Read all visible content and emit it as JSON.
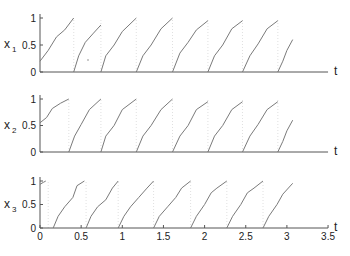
{
  "chart_data": {
    "type": "line",
    "layout": "3 stacked panels sharing time axis",
    "grid": false,
    "legend": null,
    "x_axis": {
      "label": "t",
      "range": [
        0,
        3.5
      ],
      "ticks": [
        "0",
        "0.5",
        "1",
        "1.5",
        "2",
        "2.5",
        "3",
        "3.5"
      ],
      "tick_labels_shown_on": "bottom panel only"
    },
    "colors": {
      "line": "#7a7a7a",
      "axis": "#555555",
      "reset_marker": "#d8d8d8",
      "text": "#222222"
    },
    "panels": [
      {
        "ylabel": "x",
        "ylabel_sub": "1",
        "ylim": [
          0,
          1
        ],
        "yticks": [
          "0",
          "0.5",
          "1"
        ],
        "description": "sawtooth-like phase variable rising from 0 to ~1 then resetting",
        "segments": [
          [
            [
              0,
              0.2
            ],
            [
              0.1,
              0.4
            ],
            [
              0.2,
              0.65
            ],
            [
              0.3,
              0.78
            ],
            [
              0.41,
              1.0
            ]
          ],
          [
            [
              0.41,
              0
            ],
            [
              0.47,
              0.3
            ],
            [
              0.55,
              0.55
            ],
            [
              0.65,
              0.72
            ],
            [
              0.74,
              0.87
            ]
          ],
          [
            [
              0.74,
              0
            ],
            [
              0.8,
              0.3
            ],
            [
              0.9,
              0.5
            ],
            [
              1.0,
              0.75
            ],
            [
              1.17,
              1.0
            ]
          ],
          [
            [
              1.17,
              0
            ],
            [
              1.25,
              0.3
            ],
            [
              1.35,
              0.5
            ],
            [
              1.47,
              0.8
            ],
            [
              1.61,
              1.0
            ]
          ],
          [
            [
              1.61,
              0
            ],
            [
              1.7,
              0.35
            ],
            [
              1.8,
              0.55
            ],
            [
              1.9,
              0.78
            ],
            [
              2.04,
              0.95
            ]
          ],
          [
            [
              2.04,
              0
            ],
            [
              2.12,
              0.3
            ],
            [
              2.22,
              0.5
            ],
            [
              2.33,
              0.8
            ],
            [
              2.46,
              0.95
            ]
          ],
          [
            [
              2.46,
              0
            ],
            [
              2.55,
              0.3
            ],
            [
              2.65,
              0.52
            ],
            [
              2.76,
              0.8
            ],
            [
              2.89,
              0.95
            ]
          ],
          [
            [
              2.89,
              0
            ],
            [
              2.95,
              0.2
            ],
            [
              3.0,
              0.4
            ],
            [
              3.07,
              0.6
            ]
          ]
        ],
        "resets": [
          0.41,
          0.74,
          1.17,
          1.61,
          2.04,
          2.46,
          2.89
        ]
      },
      {
        "ylabel": "x",
        "ylabel_sub": "2",
        "ylim": [
          0,
          1
        ],
        "yticks": [
          "0",
          "0.5",
          "1"
        ],
        "segments": [
          [
            [
              0,
              0.55
            ],
            [
              0.08,
              0.65
            ],
            [
              0.15,
              0.82
            ],
            [
              0.25,
              0.92
            ],
            [
              0.35,
              1.0
            ]
          ],
          [
            [
              0.35,
              0
            ],
            [
              0.42,
              0.3
            ],
            [
              0.5,
              0.52
            ],
            [
              0.6,
              0.8
            ],
            [
              0.74,
              1.0
            ]
          ],
          [
            [
              0.74,
              0
            ],
            [
              0.8,
              0.3
            ],
            [
              0.9,
              0.5
            ],
            [
              1.0,
              0.8
            ],
            [
              1.17,
              1.0
            ]
          ],
          [
            [
              1.17,
              0
            ],
            [
              1.25,
              0.3
            ],
            [
              1.35,
              0.5
            ],
            [
              1.47,
              0.8
            ],
            [
              1.61,
              1.0
            ]
          ],
          [
            [
              1.61,
              0
            ],
            [
              1.7,
              0.3
            ],
            [
              1.8,
              0.5
            ],
            [
              1.9,
              0.8
            ],
            [
              2.04,
              0.95
            ]
          ],
          [
            [
              2.04,
              0
            ],
            [
              2.12,
              0.3
            ],
            [
              2.22,
              0.5
            ],
            [
              2.33,
              0.8
            ],
            [
              2.46,
              0.95
            ]
          ],
          [
            [
              2.46,
              0
            ],
            [
              2.55,
              0.3
            ],
            [
              2.65,
              0.52
            ],
            [
              2.76,
              0.8
            ],
            [
              2.89,
              0.95
            ]
          ],
          [
            [
              2.89,
              0
            ],
            [
              2.95,
              0.2
            ],
            [
              3.0,
              0.4
            ],
            [
              3.07,
              0.6
            ]
          ]
        ],
        "resets": [
          0.35,
          0.74,
          1.17,
          1.61,
          2.04,
          2.46,
          2.89
        ]
      },
      {
        "ylabel": "x",
        "ylabel_sub": "3",
        "ylim": [
          0,
          1
        ],
        "yticks": [
          "0",
          "0.5",
          "1"
        ],
        "segments": [
          [
            [
              0,
              0.93
            ],
            [
              0.04,
              0.97
            ],
            [
              0.07,
              1.0
            ]
          ],
          [
            [
              0.16,
              0
            ],
            [
              0.22,
              0.25
            ],
            [
              0.3,
              0.45
            ],
            [
              0.4,
              0.65
            ],
            [
              0.45,
              0.9
            ],
            [
              0.54,
              1.0
            ]
          ],
          [
            [
              0.56,
              0
            ],
            [
              0.62,
              0.25
            ],
            [
              0.7,
              0.45
            ],
            [
              0.8,
              0.6
            ],
            [
              0.88,
              0.85
            ],
            [
              0.95,
              1.0
            ]
          ],
          [
            [
              0.95,
              0
            ],
            [
              1.02,
              0.25
            ],
            [
              1.1,
              0.45
            ],
            [
              1.2,
              0.65
            ],
            [
              1.3,
              0.85
            ],
            [
              1.38,
              1.0
            ]
          ],
          [
            [
              1.38,
              0
            ],
            [
              1.45,
              0.25
            ],
            [
              1.55,
              0.45
            ],
            [
              1.65,
              0.65
            ],
            [
              1.72,
              0.85
            ],
            [
              1.83,
              1.0
            ]
          ],
          [
            [
              1.83,
              0
            ],
            [
              1.9,
              0.25
            ],
            [
              2.0,
              0.5
            ],
            [
              2.08,
              0.75
            ],
            [
              2.15,
              0.85
            ],
            [
              2.27,
              1.0
            ]
          ],
          [
            [
              2.27,
              0
            ],
            [
              2.34,
              0.25
            ],
            [
              2.44,
              0.5
            ],
            [
              2.52,
              0.75
            ],
            [
              2.6,
              0.85
            ],
            [
              2.71,
              1.0
            ]
          ],
          [
            [
              2.71,
              0
            ],
            [
              2.78,
              0.25
            ],
            [
              2.88,
              0.5
            ],
            [
              2.95,
              0.72
            ],
            [
              3.07,
              0.95
            ]
          ]
        ],
        "resets": [
          0.1,
          0.56,
          0.95,
          1.38,
          1.83,
          2.27,
          2.71
        ]
      }
    ]
  }
}
